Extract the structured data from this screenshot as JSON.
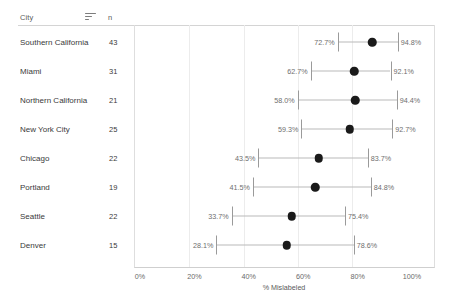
{
  "table": {
    "columns": {
      "city": "City",
      "n": "n"
    },
    "sort_icon": "sort-descending-icon"
  },
  "axis_title": "% Mislabeled",
  "chart_data": {
    "type": "scatter",
    "title": "",
    "xlabel": "% Mislabeled",
    "ylabel": "City",
    "xlim": [
      0,
      100
    ],
    "xticks": [
      "0%",
      "20%",
      "40%",
      "60%",
      "80%",
      "100%"
    ],
    "xtick_values": [
      0,
      20,
      40,
      60,
      80,
      100
    ],
    "grid": true,
    "legend": "none",
    "orientation": "horizontal",
    "categories": [
      "Southern California",
      "Miami",
      "Northern California",
      "New York City",
      "Chicago",
      "Portland",
      "Seattle",
      "Denver"
    ],
    "n": [
      43,
      31,
      21,
      25,
      22,
      19,
      22,
      15
    ],
    "points": [
      {
        "city": "Southern California",
        "n": 43,
        "estimate": 85.4,
        "low": 72.7,
        "high": 94.8,
        "low_label": "72.7%",
        "high_label": "94.8%"
      },
      {
        "city": "Miami",
        "n": 31,
        "estimate": 78.8,
        "low": 62.7,
        "high": 92.1,
        "low_label": "62.7%",
        "high_label": "92.1%"
      },
      {
        "city": "Northern California",
        "n": 21,
        "estimate": 79.2,
        "low": 58.0,
        "high": 94.4,
        "low_label": "58.0%",
        "high_label": "94.4%"
      },
      {
        "city": "New York City",
        "n": 25,
        "estimate": 77.1,
        "low": 59.3,
        "high": 92.7,
        "low_label": "59.3%",
        "high_label": "92.7%"
      },
      {
        "city": "Chicago",
        "n": 22,
        "estimate": 65.7,
        "low": 43.5,
        "high": 83.7,
        "low_label": "43.5%",
        "high_label": "83.7%"
      },
      {
        "city": "Portland",
        "n": 19,
        "estimate": 64.5,
        "low": 41.5,
        "high": 84.8,
        "low_label": "41.5%",
        "high_label": "84.8%"
      },
      {
        "city": "Seattle",
        "n": 22,
        "estimate": 55.8,
        "low": 33.7,
        "high": 75.4,
        "low_label": "33.7%",
        "high_label": "75.4%"
      },
      {
        "city": "Denver",
        "n": 15,
        "estimate": 54.0,
        "low": 28.1,
        "high": 78.6,
        "low_label": "28.1%",
        "high_label": "78.6%"
      }
    ]
  }
}
